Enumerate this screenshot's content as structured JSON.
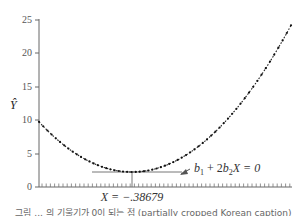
{
  "chart_data": {
    "type": "line",
    "title": "",
    "xlabel": "",
    "ylabel": "Ŷ",
    "ylim": [
      0,
      25
    ],
    "yticks": [
      0,
      5,
      10,
      15,
      20,
      25
    ],
    "grid": false,
    "legend": null,
    "series": [
      {
        "name": "quadratic fit Ŷ",
        "style": "dotted-line",
        "description": "U-shaped parabola: starts at Ŷ=10 at the y-axis, descends to a minimum of about 2.2 at X = -.38679, then rises to about 23.3 at the right edge",
        "points_approx": [
          {
            "position": "left edge",
            "y": 10
          },
          {
            "position": "minimum (X = -.38679)",
            "y": 2.2
          },
          {
            "position": "right edge",
            "y": 23.3
          }
        ]
      }
    ],
    "annotations": [
      {
        "text_parts": [
          "b",
          "1",
          " + 2",
          "b",
          "2",
          "X = 0"
        ],
        "text": "b1 + 2b2X = 0",
        "meaning": "tangent slope zero at minimum"
      },
      {
        "text": "X = −.38679",
        "position": "below x-axis at minimum"
      }
    ]
  },
  "labels": {
    "y_axis": "Ŷ",
    "tick_0": "0",
    "tick_5": "5",
    "tick_10": "10",
    "tick_15": "15",
    "tick_20": "20",
    "tick_25": "25",
    "ann_b": "b",
    "ann_sub1": "1",
    "ann_plus": " + 2",
    "ann_b2": "b",
    "ann_sub2": "2",
    "ann_rest": "X = 0",
    "xmin_label": "X = −.38679",
    "caption": "그림 ... 의 기울기가 0이 되는 점 (partially cropped Korean caption)"
  }
}
